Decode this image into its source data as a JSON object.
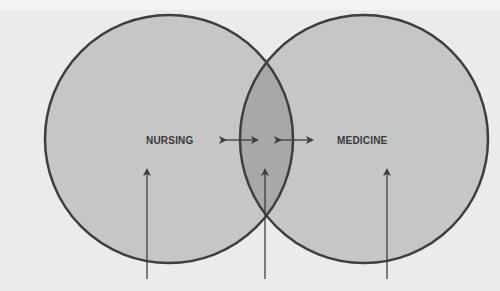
{
  "diagram": {
    "type": "venn",
    "sets": [
      {
        "label": "NURSING",
        "fill": "#c4c4c4"
      },
      {
        "label": "MEDICINE",
        "fill": "#c4c4c4"
      }
    ],
    "overlap_fill": "#a6a6a6",
    "stroke_color": "#3e3e3e",
    "background": "#ebebeb",
    "arrows": [
      {
        "kind": "double-headed",
        "position": "between NURSING and overlap"
      },
      {
        "kind": "double-headed",
        "position": "between overlap and MEDICINE"
      },
      {
        "kind": "up",
        "points_to": "NURSING"
      },
      {
        "kind": "up",
        "points_to": "overlap"
      },
      {
        "kind": "up",
        "points_to": "MEDICINE"
      }
    ]
  }
}
